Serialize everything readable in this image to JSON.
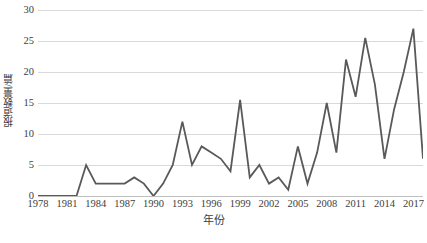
{
  "chart_data": {
    "type": "line",
    "title": "",
    "xlabel": "年份",
    "ylabel": "报道数量/篇",
    "xlim": [
      1978,
      2018
    ],
    "ylim": [
      0,
      30
    ],
    "yticks": [
      0,
      5,
      10,
      15,
      20,
      25,
      30
    ],
    "xticks": [
      1978,
      1981,
      1984,
      1987,
      1990,
      1993,
      1996,
      1999,
      2002,
      2005,
      2008,
      2011,
      2014,
      2017
    ],
    "grid": true,
    "legend": "none",
    "line_color": "#595959",
    "x": [
      1978,
      1979,
      1980,
      1981,
      1982,
      1983,
      1984,
      1985,
      1986,
      1987,
      1988,
      1989,
      1990,
      1991,
      1992,
      1993,
      1994,
      1995,
      1996,
      1997,
      1998,
      1999,
      2000,
      2001,
      2002,
      2003,
      2004,
      2005,
      2006,
      2007,
      2008,
      2009,
      2010,
      2011,
      2012,
      2013,
      2014,
      2015,
      2016,
      2017,
      2018
    ],
    "values": [
      0,
      0,
      0,
      0,
      0,
      5,
      2,
      2,
      2,
      2,
      3,
      2,
      0,
      2,
      5,
      12,
      5,
      8,
      7,
      6,
      4,
      15.5,
      3,
      5,
      2,
      3,
      1,
      8,
      2,
      7,
      15,
      7,
      22,
      16,
      25.5,
      18,
      6,
      14,
      20,
      27,
      6
    ],
    "series_name": "报道数量/篇"
  },
  "y_axis": {
    "label": "报道数量/篇",
    "ticks": [
      "30",
      "25",
      "20",
      "15",
      "10",
      "5",
      "0"
    ]
  },
  "x_axis": {
    "label": "年份",
    "ticks": [
      "1978",
      "1981",
      "1984",
      "1987",
      "1990",
      "1993",
      "1996",
      "1999",
      "2002",
      "2005",
      "2008",
      "2011",
      "2014",
      "2017"
    ]
  }
}
